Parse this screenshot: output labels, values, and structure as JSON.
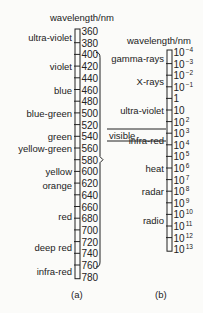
{
  "scale_a": {
    "heading": "wavelength/nm",
    "caption": "(a)",
    "ticks": [
      "360",
      "380",
      "400",
      "420",
      "440",
      "460",
      "480",
      "500",
      "520",
      "540",
      "560",
      "580",
      "600",
      "620",
      "640",
      "660",
      "680",
      "700",
      "720",
      "740",
      "760",
      "780"
    ],
    "bands": [
      {
        "label": "ultra-violet",
        "at": 0.5
      },
      {
        "label": "violet",
        "at": 3
      },
      {
        "label": "blue",
        "at": 5
      },
      {
        "label": "blue-green",
        "at": 7
      },
      {
        "label": "green",
        "at": 9
      },
      {
        "label": "yellow-green",
        "at": 10
      },
      {
        "label": "yellow",
        "at": 12
      },
      {
        "label": "orange",
        "at": 13.2
      },
      {
        "label": "red",
        "at": 15.8
      },
      {
        "label": "deep red",
        "at": 18.5
      },
      {
        "label": "infra-red",
        "at": 20.5
      }
    ],
    "bracket_from_tick": 2,
    "bracket_to_tick": 20
  },
  "scale_b": {
    "heading": "wavelength/nm",
    "caption": "(b)",
    "ticks": [
      {
        "base": "10",
        "exp": "−4"
      },
      {
        "base": "10",
        "exp": "−3"
      },
      {
        "base": "10",
        "exp": "−2"
      },
      {
        "base": "10",
        "exp": "−1"
      },
      {
        "base": "1",
        "exp": ""
      },
      {
        "base": "10",
        "exp": ""
      },
      {
        "base": "10",
        "exp": "2"
      },
      {
        "base": "10",
        "exp": "3"
      },
      {
        "base": "10",
        "exp": "4"
      },
      {
        "base": "10",
        "exp": "5"
      },
      {
        "base": "10",
        "exp": "6"
      },
      {
        "base": "10",
        "exp": "7"
      },
      {
        "base": "10",
        "exp": "8"
      },
      {
        "base": "10",
        "exp": "9"
      },
      {
        "base": "10",
        "exp": "10"
      },
      {
        "base": "10",
        "exp": "11"
      },
      {
        "base": "10",
        "exp": "12"
      },
      {
        "base": "10",
        "exp": "13"
      }
    ],
    "bands": [
      {
        "label": "gamma-rays",
        "at": 0.5
      },
      {
        "label": "X-rays",
        "at": 2.5
      },
      {
        "label": "ultra-violet",
        "at": 5
      },
      {
        "label": "infra-red",
        "at": 7.6
      },
      {
        "label": "heat",
        "at": 10
      },
      {
        "label": "radar",
        "at": 12
      },
      {
        "label": "radio",
        "at": 14.5
      }
    ],
    "visible_label": "visible"
  }
}
